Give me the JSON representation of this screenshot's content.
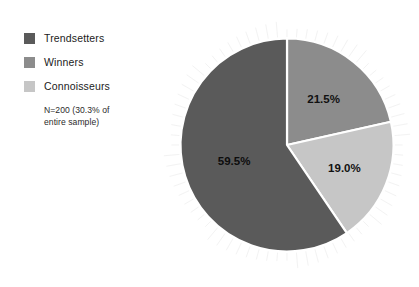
{
  "chart_data": {
    "type": "pie",
    "title": "",
    "categories": [
      "Trendsetters",
      "Winners",
      "Connoisseurs"
    ],
    "values": [
      59.5,
      21.5,
      19.0
    ],
    "value_labels": [
      "59.5%",
      "21.5%",
      "19.0%"
    ],
    "colors": [
      "#5a5a5a",
      "#8c8c8c",
      "#c6c6c6"
    ],
    "start_angle_deg": 0,
    "direction": "clockwise",
    "slice_order_clockwise_from_top": [
      "Winners",
      "Connoisseurs",
      "Trendsetters"
    ],
    "annotation": "N=200 (30.3% of entire sample)",
    "legend_position": "left",
    "background": "#ffffff"
  },
  "legend": {
    "items": [
      {
        "label": "Trendsetters",
        "color": "#5a5a5a"
      },
      {
        "label": "Winners",
        "color": "#8c8c8c"
      },
      {
        "label": "Connoisseurs",
        "color": "#c6c6c6"
      }
    ],
    "note_line1": "N=200 (30.3% of",
    "note_line2": "entire sample)"
  },
  "pie": {
    "slices": [
      {
        "name": "Winners",
        "label": "21.5%",
        "value": 21.5,
        "color": "#8c8c8c"
      },
      {
        "name": "Connoisseurs",
        "label": "19.0%",
        "value": 19.0,
        "color": "#c6c6c6"
      },
      {
        "name": "Trendsetters",
        "label": "59.5%",
        "value": 59.5,
        "color": "#5a5a5a"
      }
    ]
  }
}
